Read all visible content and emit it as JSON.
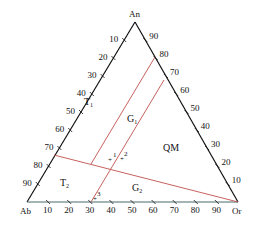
{
  "diagram": {
    "type": "ternary",
    "vertices": {
      "top": "An",
      "left": "Ab",
      "right": "Or"
    },
    "left_edge_ticks": [
      "10",
      "20",
      "30",
      "40",
      "50",
      "60",
      "70",
      "80",
      "90"
    ],
    "right_edge_ticks": [
      "90",
      "80",
      "70",
      "60",
      "50",
      "40",
      "30",
      "20",
      "10"
    ],
    "bottom_edge_ticks": [
      "10",
      "20",
      "30",
      "40",
      "50",
      "60",
      "70",
      "80",
      "90"
    ],
    "regions": {
      "T1": {
        "base": "T",
        "sub": "1"
      },
      "T2": {
        "base": "T",
        "sub": "2"
      },
      "G1": {
        "base": "G",
        "sub": "1"
      },
      "G2": {
        "base": "G",
        "sub": "2"
      },
      "QM": {
        "base": "QM",
        "sub": ""
      }
    },
    "sample_points": [
      "1",
      "2",
      "3"
    ],
    "colors": {
      "edge": "#111111",
      "boundary": "#c0504d",
      "base": "#4a6a6a"
    }
  }
}
